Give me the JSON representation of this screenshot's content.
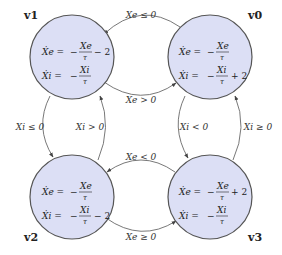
{
  "diagram": {
    "type": "state-transition",
    "node_fill": "#dcdff5",
    "node_stroke": "#555555",
    "nodes": [
      {
        "id": "v1",
        "label": "v1",
        "eq_e": {
          "lhs": "Ẋe =",
          "pre": "−",
          "num": "Xe",
          "den": "τ",
          "post": "− 2"
        },
        "eq_i": {
          "lhs": "Ẋi =",
          "pre": "−",
          "num": "Xi",
          "den": "τ",
          "post": ""
        }
      },
      {
        "id": "v0",
        "label": "v0",
        "eq_e": {
          "lhs": "Ẋe =",
          "pre": "−",
          "num": "Xe",
          "den": "τ",
          "post": ""
        },
        "eq_i": {
          "lhs": "Ẋi =",
          "pre": "−",
          "num": "Xi",
          "den": "τ",
          "post": "+ 2"
        }
      },
      {
        "id": "v2",
        "label": "v2",
        "eq_e": {
          "lhs": "Ẋe =",
          "pre": "−",
          "num": "Xe",
          "den": "τ",
          "post": ""
        },
        "eq_i": {
          "lhs": "Ẋi =",
          "pre": "−",
          "num": "Xi",
          "den": "τ",
          "post": "− 2"
        }
      },
      {
        "id": "v3",
        "label": "v3",
        "eq_e": {
          "lhs": "Ẋe =",
          "pre": "−",
          "num": "Xe",
          "den": "τ",
          "post": "+ 2"
        },
        "eq_i": {
          "lhs": "Ẋi =",
          "pre": "−",
          "num": "Xi",
          "den": "τ",
          "post": ""
        }
      }
    ],
    "edges": [
      {
        "from": "v0",
        "to": "v1",
        "label": "Xe ≤ 0"
      },
      {
        "from": "v1",
        "to": "v0",
        "label": "Xe > 0"
      },
      {
        "from": "v1",
        "to": "v2",
        "label": "Xi ≤ 0"
      },
      {
        "from": "v2",
        "to": "v1",
        "label": "Xi > 0"
      },
      {
        "from": "v0",
        "to": "v3",
        "label": "Xi < 0"
      },
      {
        "from": "v3",
        "to": "v0",
        "label": "Xi ≥ 0"
      },
      {
        "from": "v3",
        "to": "v2",
        "label": "Xe < 0"
      },
      {
        "from": "v2",
        "to": "v3",
        "label": "Xe ≥ 0"
      }
    ]
  }
}
